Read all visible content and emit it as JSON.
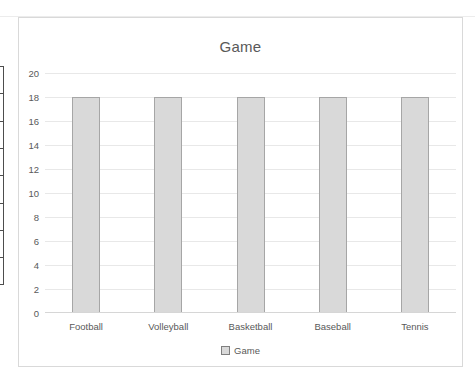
{
  "chart_data": {
    "type": "bar",
    "title": "Game",
    "categories": [
      "Football",
      "Volleyball",
      "Basketball",
      "Baseball",
      "Tennis"
    ],
    "series": [
      {
        "name": "Game",
        "values": [
          18,
          18,
          18,
          18,
          18
        ]
      }
    ],
    "ylim": [
      0,
      20
    ],
    "yticks": [
      0,
      2,
      4,
      6,
      8,
      10,
      12,
      14,
      16,
      18,
      20
    ],
    "grid": true,
    "xlabel": "",
    "ylabel": "",
    "legend": {
      "position": "bottom",
      "entries": [
        "Game"
      ]
    },
    "colors": {
      "bar_fill": "#d9d9d9",
      "bar_border": "#a6a6a6",
      "text": "#595959",
      "gridline": "#e8e8e8",
      "axis_line": "#d6d6d6",
      "chart_border": "#d9d9d9",
      "legend_marker_fill": "#d9d9d9",
      "legend_marker_border": "#7f7f7f"
    }
  }
}
